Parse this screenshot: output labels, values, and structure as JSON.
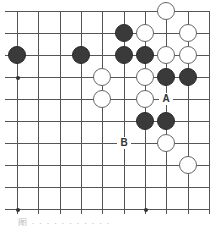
{
  "diagram": {
    "type": "go-board-fragment",
    "columns": 10,
    "rows": 10,
    "grid_origin_x": 17,
    "grid_origin_y": 11,
    "col_spacing": 21.35,
    "row_spacing": 22.0,
    "top_edge": true,
    "right_edge": true,
    "line_color": "#555555",
    "black_color": "#3a3a3a",
    "white_color": "#ffffff",
    "star_points": [
      [
        0,
        3
      ],
      [
        0,
        9
      ],
      [
        6,
        9
      ]
    ],
    "stones": [
      {
        "color": "white",
        "col": 7,
        "row": 0
      },
      {
        "color": "black",
        "col": 5,
        "row": 1
      },
      {
        "color": "white",
        "col": 6,
        "row": 1
      },
      {
        "color": "white",
        "col": 8,
        "row": 1
      },
      {
        "color": "black",
        "col": 0,
        "row": 2
      },
      {
        "color": "black",
        "col": 3,
        "row": 2
      },
      {
        "color": "black",
        "col": 5,
        "row": 2
      },
      {
        "color": "black",
        "col": 6,
        "row": 2
      },
      {
        "color": "white",
        "col": 7,
        "row": 2
      },
      {
        "color": "white",
        "col": 8,
        "row": 2
      },
      {
        "color": "white",
        "col": 4,
        "row": 3
      },
      {
        "color": "white",
        "col": 6,
        "row": 3
      },
      {
        "color": "black",
        "col": 7,
        "row": 3
      },
      {
        "color": "black",
        "col": 8,
        "row": 3
      },
      {
        "color": "white",
        "col": 4,
        "row": 4
      },
      {
        "color": "white",
        "col": 6,
        "row": 4
      },
      {
        "color": "black",
        "col": 6,
        "row": 5
      },
      {
        "color": "black",
        "col": 7,
        "row": 5
      },
      {
        "color": "white",
        "col": 7,
        "row": 6
      },
      {
        "color": "white",
        "col": 8,
        "row": 7
      }
    ],
    "labels": [
      {
        "text": "A",
        "col": 7,
        "row": 4
      },
      {
        "text": "B",
        "col": 5,
        "row": 6
      }
    ]
  },
  "caption": "图 · · · · · · · · · · ·"
}
